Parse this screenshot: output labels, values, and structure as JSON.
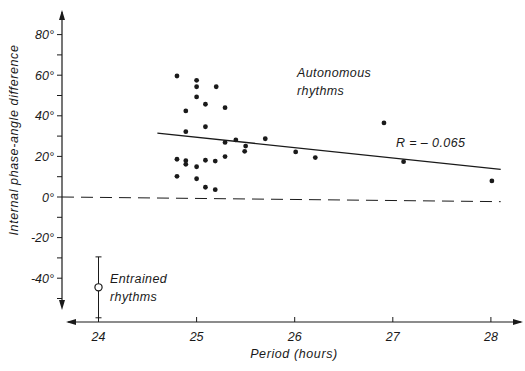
{
  "chart_data": {
    "type": "scatter",
    "title": "",
    "xlabel": "Period (hours)",
    "ylabel": "Internal phase-angle difference",
    "xlim": [
      23.45,
      28.35
    ],
    "ylim": [
      -57,
      92
    ],
    "xticks": [
      24,
      25,
      26,
      27,
      28
    ],
    "xtick_labels": [
      "24",
      "25",
      "26",
      "27",
      "28"
    ],
    "yticks": [
      80,
      70,
      60,
      50,
      40,
      30,
      20,
      10,
      0,
      -10,
      -20,
      -30,
      -40,
      -50
    ],
    "ytick_labels": [
      {
        "value": 80,
        "label": "80°"
      },
      {
        "value": 60,
        "label": "60°"
      },
      {
        "value": 40,
        "label": "40°"
      },
      {
        "value": 20,
        "label": "20°"
      },
      {
        "value": 0,
        "label": "0°"
      },
      {
        "value": -20,
        "label": "-20°"
      },
      {
        "value": -40,
        "label": "-40°"
      }
    ],
    "grid": false,
    "series": [
      {
        "name": "Autonomous rhythms",
        "marker": "filled-circle",
        "points": [
          [
            24.8,
            59.6
          ],
          [
            25.0,
            57.5
          ],
          [
            25.0,
            54.3
          ],
          [
            25.2,
            54.3
          ],
          [
            25.0,
            49.3
          ],
          [
            25.09,
            45.7
          ],
          [
            25.29,
            44.0
          ],
          [
            24.89,
            42.4
          ],
          [
            25.09,
            34.6
          ],
          [
            24.89,
            32.2
          ],
          [
            25.29,
            26.9
          ],
          [
            25.4,
            28.1
          ],
          [
            24.8,
            18.6
          ],
          [
            24.89,
            17.9
          ],
          [
            24.89,
            16.1
          ],
          [
            25.0,
            14.9
          ],
          [
            25.09,
            18.1
          ],
          [
            25.19,
            17.7
          ],
          [
            25.29,
            19.9
          ],
          [
            24.8,
            10.2
          ],
          [
            25.0,
            9.0
          ],
          [
            25.09,
            4.8
          ],
          [
            25.19,
            3.6
          ],
          [
            25.5,
            25.1
          ],
          [
            25.49,
            22.5
          ],
          [
            25.7,
            28.7
          ],
          [
            26.01,
            22.2
          ],
          [
            26.21,
            19.4
          ],
          [
            26.91,
            36.5
          ],
          [
            27.11,
            17.4
          ],
          [
            28.01,
            7.9
          ]
        ]
      },
      {
        "name": "Entrained rhythms",
        "marker": "open-circle",
        "points": [
          [
            24.0,
            -44.5
          ]
        ],
        "error_bar": {
          "low": -59.5,
          "high": -29.5
        }
      }
    ],
    "regression_line": {
      "label": "R = – 0.065",
      "x": [
        24.6,
        28.1
      ],
      "y": [
        31.5,
        13.6
      ]
    },
    "reference_line": {
      "style": "dashed",
      "x": [
        23.45,
        28.1
      ],
      "y": [
        0,
        -2.3
      ]
    },
    "annotations": [
      {
        "text_lines": [
          "Autonomous",
          "rhythms"
        ],
        "x": 26.0,
        "y": 80
      },
      {
        "text_lines": [
          "R = – 0.065"
        ],
        "x": 27.0,
        "y": 34
      },
      {
        "text_lines": [
          "Entrained",
          "rhythms"
        ],
        "x": 24.2,
        "y": -41
      }
    ]
  },
  "labels": {
    "xlabel": "Period (hours)",
    "ylabel": "Internal phase-angle difference",
    "annot_autonomous_1": "Autonomous",
    "annot_autonomous_2": "rhythms",
    "annot_r": "R = – 0.065",
    "annot_entrained_1": "Entrained",
    "annot_entrained_2": "rhythms"
  },
  "colors": {
    "ink": "#1a1a1a",
    "background": "#ffffff"
  }
}
